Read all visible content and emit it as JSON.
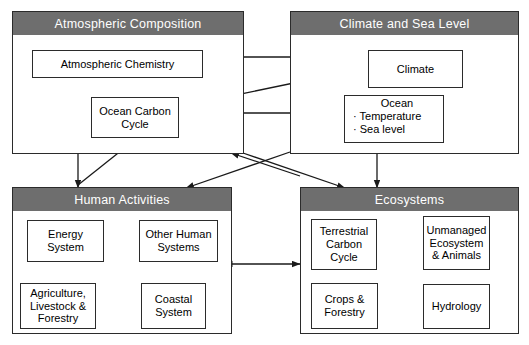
{
  "diagram": {
    "colors": {
      "header_bg": "#6e6e6e",
      "header_text": "#ffffff",
      "box_border": "#2b2b2b",
      "arrow": "#1a1a1a",
      "background": "#ffffff"
    },
    "panels": [
      {
        "id": "atmospheric-composition",
        "header": "Atmospheric Composition",
        "nodes": [
          {
            "id": "atmospheric-chemistry",
            "label": "Atmospheric Chemistry"
          },
          {
            "id": "ocean-carbon-cycle",
            "label": "Ocean Carbon Cycle",
            "line1": "Ocean Carbon",
            "line2": "Cycle"
          }
        ]
      },
      {
        "id": "climate-and-sea-level",
        "header": "Climate and Sea Level",
        "nodes": [
          {
            "id": "climate",
            "label": "Climate"
          },
          {
            "id": "ocean",
            "label": "Ocean",
            "bullets": [
              "· Temperature",
              "· Sea level"
            ]
          }
        ]
      },
      {
        "id": "human-activities",
        "header": "Human Activities",
        "nodes": [
          {
            "id": "energy-system",
            "label": "Energy System",
            "line1": "Energy",
            "line2": "System"
          },
          {
            "id": "other-human-systems",
            "label": "Other Human Systems",
            "line1": "Other Human",
            "line2": "Systems"
          },
          {
            "id": "agriculture-livestock-forestry",
            "label": "Agriculture, Livestock & Forestry",
            "line1": "Agriculture,",
            "line2": "Livestock &",
            "line3": "Forestry"
          },
          {
            "id": "coastal-system",
            "label": "Coastal System",
            "line1": "Coastal",
            "line2": "System"
          }
        ]
      },
      {
        "id": "ecosystems",
        "header": "Ecosystems",
        "nodes": [
          {
            "id": "terrestrial-carbon-cycle",
            "label": "Terrestrial Carbon Cycle",
            "line1": "Terrestrial",
            "line2": "Carbon",
            "line3": "Cycle"
          },
          {
            "id": "unmanaged-ecosystem-animals",
            "label": "Unmanaged Ecosystem & Animals",
            "line1": "Unmanaged",
            "line2": "Ecosystem",
            "line3": "& Animals"
          },
          {
            "id": "crops-forestry",
            "label": "Crops & Forestry",
            "line1": "Crops &",
            "line2": "Forestry"
          },
          {
            "id": "hydrology",
            "label": "Hydrology"
          }
        ]
      }
    ],
    "connections": [
      {
        "from": "climate",
        "to": "atmospheric-chemistry",
        "style": "double"
      },
      {
        "from": "ocean",
        "to": "ocean-carbon-cycle",
        "style": "double"
      },
      {
        "from": "ocean-carbon-cycle",
        "to": "climate",
        "style": "single"
      },
      {
        "from": "climate",
        "to": "ocean",
        "style": "feedback-loop"
      },
      {
        "from": "atmospheric-chemistry",
        "to": "human-activities",
        "style": "double"
      },
      {
        "from": "human-activities",
        "to": "ocean-carbon-cycle",
        "style": "single"
      },
      {
        "from": "climate-and-sea-level",
        "to": "ecosystems",
        "style": "double"
      },
      {
        "from": "human-activities",
        "to": "ecosystems",
        "style": "double"
      },
      {
        "from": "atmospheric-composition",
        "to": "ecosystems",
        "style": "single"
      },
      {
        "from": "climate-and-sea-level",
        "to": "human-activities",
        "style": "single"
      },
      {
        "from": "energy-system",
        "to": "other-human-systems",
        "style": "double"
      },
      {
        "from": "energy-system",
        "to": "agriculture-livestock-forestry",
        "style": "double"
      },
      {
        "from": "energy-system",
        "to": "coastal-system",
        "style": "double"
      },
      {
        "from": "other-human-systems",
        "to": "agriculture-livestock-forestry",
        "style": "double"
      },
      {
        "from": "other-human-systems",
        "to": "coastal-system",
        "style": "double"
      },
      {
        "from": "agriculture-livestock-forestry",
        "to": "coastal-system",
        "style": "double"
      },
      {
        "from": "terrestrial-carbon-cycle",
        "to": "unmanaged-ecosystem-animals",
        "style": "double"
      },
      {
        "from": "terrestrial-carbon-cycle",
        "to": "crops-forestry",
        "style": "double"
      },
      {
        "from": "terrestrial-carbon-cycle",
        "to": "hydrology",
        "style": "double"
      },
      {
        "from": "unmanaged-ecosystem-animals",
        "to": "crops-forestry",
        "style": "double"
      },
      {
        "from": "unmanaged-ecosystem-animals",
        "to": "hydrology",
        "style": "double"
      },
      {
        "from": "crops-forestry",
        "to": "hydrology",
        "style": "double"
      }
    ]
  }
}
